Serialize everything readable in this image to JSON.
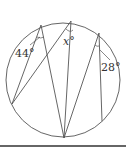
{
  "diagram": {
    "type": "inscribed-angles-circle",
    "labels": {
      "angle_left": "44°",
      "angle_middle": "x°",
      "angle_right": "28°"
    },
    "colors": {
      "stroke": "#555555",
      "text": "#333333",
      "rule": "#666666"
    }
  }
}
